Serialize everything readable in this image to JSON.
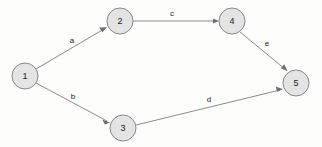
{
  "diagram": {
    "background_color": "#fdfdfc",
    "node_fill_color": "#e4e4e4",
    "node_stroke_color": "#8a8a8a",
    "edge_color": "#8c8c8c",
    "arrow_color": "#6f6f6f",
    "text_color": "#1b1b1b",
    "nodes": [
      {
        "id": "1",
        "label": "1",
        "cx": 25,
        "cy": 76,
        "r": 13
      },
      {
        "id": "2",
        "label": "2",
        "cx": 120,
        "cy": 21,
        "r": 13
      },
      {
        "id": "3",
        "label": "3",
        "cx": 123,
        "cy": 128,
        "r": 13
      },
      {
        "id": "4",
        "label": "4",
        "cx": 232,
        "cy": 21,
        "r": 13
      },
      {
        "id": "5",
        "label": "5",
        "cx": 296,
        "cy": 83,
        "r": 13
      }
    ],
    "edges": [
      {
        "id": "a",
        "label": "a",
        "from": "1",
        "to": "2",
        "label_x": 72,
        "label_y": 40
      },
      {
        "id": "b",
        "label": "b",
        "from": "1",
        "to": "3",
        "label_x": 73,
        "label_y": 96
      },
      {
        "id": "c",
        "label": "c",
        "from": "2",
        "to": "4",
        "label_x": 172,
        "label_y": 13
      },
      {
        "id": "d",
        "label": "d",
        "from": "3",
        "to": "5",
        "label_x": 209,
        "label_y": 99
      },
      {
        "id": "e",
        "label": "e",
        "from": "4",
        "to": "5",
        "label_x": 267,
        "label_y": 43
      }
    ]
  }
}
